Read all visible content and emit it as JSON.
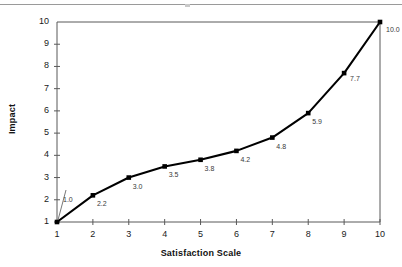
{
  "chart_data": {
    "type": "line",
    "title": "",
    "xlabel": "Satisfaction Scale",
    "ylabel": "Impact",
    "x": [
      1,
      2,
      3,
      4,
      5,
      6,
      7,
      8,
      9,
      10
    ],
    "values": [
      1.0,
      2.2,
      3.0,
      3.5,
      3.8,
      4.2,
      4.8,
      5.9,
      7.7,
      10.0
    ],
    "point_labels": [
      "1.0",
      "2.2",
      "3.0",
      "3.5",
      "3.8",
      "4.2",
      "4.8",
      "5.9",
      "7.7",
      "10.0"
    ],
    "xtick_labels": [
      "1",
      "2",
      "3",
      "4",
      "5",
      "6",
      "7",
      "8",
      "9",
      "10"
    ],
    "ytick_labels": [
      "1",
      "2",
      "3",
      "4",
      "5",
      "6",
      "7",
      "8",
      "9",
      "10"
    ],
    "xlim": [
      1,
      10
    ],
    "ylim": [
      1,
      10
    ],
    "grid": false,
    "legend": "none",
    "series_color": "#000000",
    "label_color": "#3a3a3a",
    "axis_color": "#595959"
  },
  "decor": {
    "top_rule_color": "#9a9a9a"
  }
}
